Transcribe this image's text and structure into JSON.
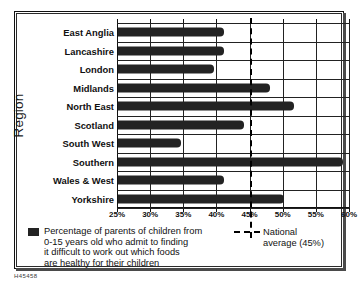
{
  "figure": {
    "reference_code": "H45458",
    "ylabel": "Region"
  },
  "legend": {
    "series_swatch_name": "bar-series-swatch",
    "series_lines": [
      "Percentage of parents of children from",
      "0-15 years old who admit to finding",
      "it difficult to work out which foods",
      "are healthy for their children"
    ],
    "average_line1": "National",
    "average_line2": "average (45%)"
  },
  "colors": {
    "bar": "#232323",
    "axis": "#111111",
    "grid": "#222222",
    "background": "#ffffff"
  },
  "chart_data": {
    "type": "bar",
    "orientation": "horizontal",
    "title": "",
    "xlabel": "",
    "ylabel": "Region",
    "xlim": [
      25,
      60
    ],
    "xticks": [
      25,
      30,
      35,
      40,
      45,
      50,
      55,
      60
    ],
    "xticklabels": [
      "25%",
      "30%",
      "35%",
      "40%",
      "45%",
      "50%",
      "55%",
      "60%"
    ],
    "grid": true,
    "legend_position": "below",
    "categories": [
      "East Anglia",
      "Lancashire",
      "London",
      "Midlands",
      "North East",
      "Scotland",
      "South West",
      "Southern",
      "Wales & West",
      "Yorkshire"
    ],
    "values": [
      41,
      41,
      39.5,
      48,
      51.5,
      44,
      34.5,
      59,
      41,
      50
    ],
    "series": [
      {
        "name": "Percentage of parents of children from 0-15 years old who admit to finding it difficult to work out which foods are healthy for their children",
        "values": [
          41,
          41,
          39.5,
          48,
          51.5,
          44,
          34.5,
          59,
          41,
          50
        ]
      }
    ],
    "annotations": [
      {
        "type": "vline",
        "value": 45,
        "label": "National average (45%)",
        "style": "dashed"
      }
    ]
  }
}
